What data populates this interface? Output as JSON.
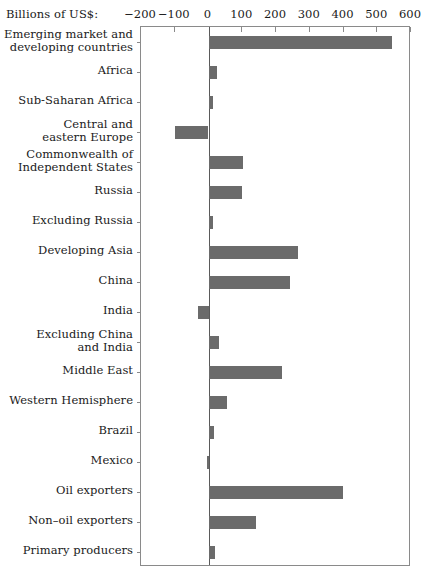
{
  "axis": {
    "units_caption": "Billions of US$:",
    "ticks": [
      -200,
      -100,
      0,
      100,
      200,
      300,
      400,
      500,
      600
    ],
    "tick_labels": [
      "−200",
      "−100",
      "0",
      "100",
      "200",
      "300",
      "400",
      "500",
      "600"
    ]
  },
  "colors": {
    "bar": "#6b6b6b",
    "frame": "#8a8a8a",
    "zero_line": "#5a5a5a",
    "text": "#1a1a1a",
    "background": "#ffffff"
  },
  "chart_data": {
    "type": "bar",
    "orientation": "horizontal",
    "title": "",
    "subtitle": "",
    "xlabel": "Billions of US$:",
    "ylabel": "",
    "xlim": [
      -200,
      600
    ],
    "grid": false,
    "legend": "none",
    "categories": [
      "Emerging market and developing countries",
      "Africa",
      "Sub-Saharan Africa",
      "Central and eastern Europe",
      "Commonwealth of Independent States",
      "Russia",
      "Excluding Russia",
      "Developing Asia",
      "China",
      "India",
      "Excluding China and India",
      "Middle East",
      "Western Hemisphere",
      "Brazil",
      "Mexico",
      "Oil exporters",
      "Non–oil exporters",
      "Primary producers"
    ],
    "category_labels": [
      [
        "Emerging market and",
        "developing countries"
      ],
      [
        "Africa"
      ],
      [
        "Sub-Saharan Africa"
      ],
      [
        "Central and",
        "eastern Europe"
      ],
      [
        "Commonwealth of",
        "Independent States"
      ],
      [
        "Russia"
      ],
      [
        "Excluding Russia"
      ],
      [
        "Developing Asia"
      ],
      [
        "China"
      ],
      [
        "India"
      ],
      [
        "Excluding China",
        "and India"
      ],
      [
        "Middle East"
      ],
      [
        "Western Hemisphere"
      ],
      [
        "Brazil"
      ],
      [
        "Mexico"
      ],
      [
        "Oil exporters"
      ],
      [
        "Non–oil exporters"
      ],
      [
        "Primary producers"
      ]
    ],
    "values": [
      543,
      25,
      12,
      -99,
      102,
      100,
      12,
      264,
      242,
      -30,
      30,
      219,
      54,
      17,
      -5,
      398,
      142,
      18
    ]
  }
}
